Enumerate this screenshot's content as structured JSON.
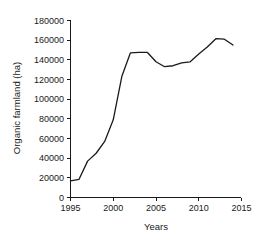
{
  "chart_data": {
    "type": "line",
    "title": "",
    "xlabel": "Years",
    "ylabel": "Organic farmland (ha)",
    "xlim": [
      1995,
      2015
    ],
    "ylim": [
      0,
      180000
    ],
    "grid": false,
    "legend": "none",
    "x_ticks": [
      1995,
      2000,
      2005,
      2010,
      2015
    ],
    "x_tick_labels": [
      "1995",
      "2000",
      "2005",
      "2010",
      "2015"
    ],
    "y_ticks": [
      0,
      20000,
      40000,
      60000,
      80000,
      100000,
      120000,
      140000,
      160000,
      180000
    ],
    "y_tick_labels": [
      "0",
      "20000",
      "40000",
      "60000",
      "80000",
      "100000",
      "120000",
      "140000",
      "160000",
      "180000"
    ],
    "series": [
      {
        "name": "Organic farmland",
        "x": [
          1995,
          1996,
          1997,
          1998,
          1999,
          2000,
          2001,
          2002,
          2003,
          2004,
          2005,
          2006,
          2007,
          2008,
          2009,
          2010,
          2011,
          2012,
          2013,
          2014
        ],
        "values": [
          17000,
          18500,
          37000,
          45000,
          57000,
          79000,
          123000,
          147000,
          147500,
          147500,
          138000,
          133000,
          134000,
          137000,
          138000,
          146000,
          153000,
          161500,
          161000,
          155000
        ]
      }
    ]
  },
  "axes": {
    "y_axis_title": "Organic farmland (ha)",
    "x_axis_title": "Years"
  }
}
